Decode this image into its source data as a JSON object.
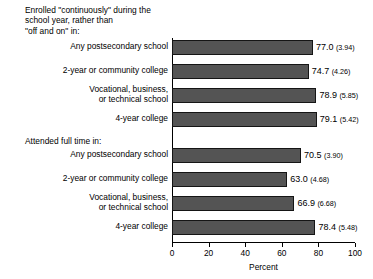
{
  "chart_data": {
    "type": "bar",
    "orientation": "horizontal",
    "title": "",
    "xlabel": "Percent",
    "ylabel": "",
    "xlim": [
      0,
      100
    ],
    "xticks": [
      0,
      20,
      40,
      60,
      80,
      100
    ],
    "xtick_labels": [
      "0",
      "20",
      "40",
      "60",
      "80",
      "100"
    ],
    "grid": false,
    "legend": null,
    "value_label_format": "value (standard error)",
    "bar_color": "#545454",
    "bar_edge_color": "#151515",
    "groups": [
      {
        "heading": "Enrolled \"continuously\" during the\nschool year, rather than\n\"off and on\" in:",
        "categories": [
          "Any postsecondary school",
          "2-year or community college",
          "Vocational, business,\nor technical school",
          "4-year college"
        ],
        "values": [
          77.0,
          74.7,
          78.9,
          79.1
        ],
        "standard_errors": [
          3.94,
          4.26,
          5.85,
          5.42
        ],
        "value_labels": [
          "77.0",
          "74.7",
          "78.9",
          "79.1"
        ],
        "se_labels": [
          "(3.94)",
          "(4.26)",
          "(5.85)",
          "(5.42)"
        ]
      },
      {
        "heading": "Attended full time in:",
        "categories": [
          "Any postsecondary school",
          "2-year or community college",
          "Vocational, business,\nor technical school",
          "4-year college"
        ],
        "values": [
          70.5,
          63.0,
          66.9,
          78.4
        ],
        "standard_errors": [
          3.9,
          4.68,
          6.68,
          5.48
        ],
        "value_labels": [
          "70.5",
          "63.0",
          "66.9",
          "78.4"
        ],
        "se_labels": [
          "(3.90)",
          "(4.68)",
          "(6.68)",
          "(5.48)"
        ]
      }
    ]
  }
}
